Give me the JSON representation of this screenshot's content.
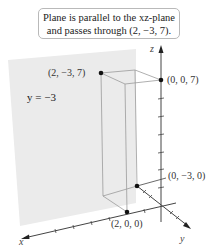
{
  "callout": {
    "line1": "Plane is parallel to the xz-plane",
    "line2": "and passes through (2, −3, 7)."
  },
  "plane_label": "y = −3",
  "axes": {
    "x": "x",
    "y": "y",
    "z": "z"
  },
  "points": [
    {
      "label": "(2, −3, 7)",
      "coords": [
        2,
        -3,
        7
      ]
    },
    {
      "label": "(0, 0, 7)",
      "coords": [
        0,
        0,
        7
      ]
    },
    {
      "label": "(0, −3, 0)",
      "coords": [
        0,
        -3,
        0
      ]
    },
    {
      "label": "(2, 0, 0)",
      "coords": [
        2,
        0,
        0
      ]
    }
  ],
  "colors": {
    "plane": "#e9e9e9",
    "axis": "#444444",
    "box": "#9a9a9a",
    "point": "#111111"
  }
}
